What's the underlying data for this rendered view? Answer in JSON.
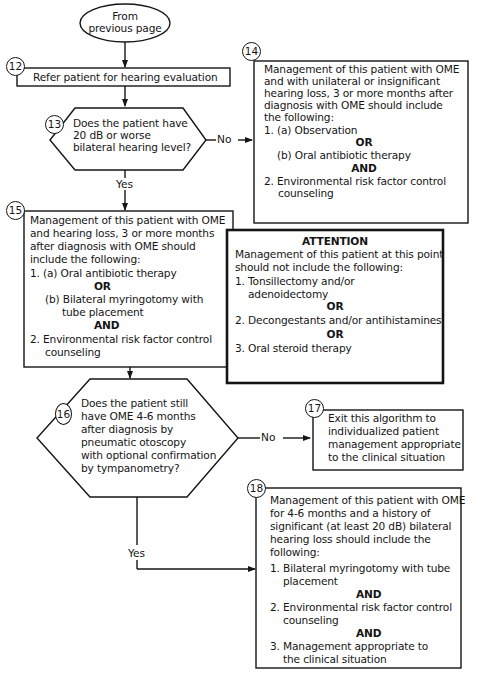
{
  "start": {
    "line1": "From",
    "line2": "previous page"
  },
  "step12": {
    "num": "12",
    "text": "Refer patient for hearing evaluation"
  },
  "step13": {
    "num": "13",
    "lines": [
      "Does the patient have",
      "20 dB or worse",
      "bilateral hearing level?"
    ],
    "yes": "Yes",
    "no": "No"
  },
  "step14": {
    "num": "14",
    "lines": [
      "Management of this patient with OME",
      "and with unilateral or insignificant",
      "hearing loss, 3 or more months after",
      "diagnosis with OME should include",
      "the following:",
      "1. (a) Observation"
    ],
    "or": "OR",
    "b": "(b) Oral antibiotic therapy",
    "and": "AND",
    "item2": [
      "2. Environmental risk factor control",
      "counseling"
    ]
  },
  "step15": {
    "num": "15",
    "lines": [
      "Management of this patient with OME",
      "and hearing loss, 3 or more months",
      "after diagnosis with OME should",
      "include the following:",
      "1. (a) Oral antibiotic therapy"
    ],
    "or": "OR",
    "b": [
      "(b) Bilateral myringotomy with",
      "tube placement"
    ],
    "and": "AND",
    "item2": [
      "2. Environmental risk factor control",
      "counseling"
    ]
  },
  "attention": {
    "heading": "ATTENTION",
    "lines": [
      "Management of this patient at this point",
      "should not include the following:",
      "1. Tonsillectomy and/or",
      "adenoidectomy"
    ],
    "or1": "OR",
    "item2": "2. Decongestants and/or antihistamines",
    "or2": "OR",
    "item3": "3. Oral steroid therapy"
  },
  "step16": {
    "num": "16",
    "lines": [
      "Does the patient still",
      "have OME 4-6 months",
      "after diagnosis by",
      "pneumatic otoscopy",
      "with optional confirmation",
      "by tympanometry?"
    ],
    "yes": "Yes",
    "no": "No"
  },
  "step17": {
    "num": "17",
    "lines": [
      "Exit this algorithm to",
      "individualized patient",
      "management appropriate",
      "to the clinical situation"
    ]
  },
  "step18": {
    "num": "18",
    "lines": [
      "Management of this patient with OME",
      "for 4-6 months and a history of",
      "significant (at least 20 dB) bilateral",
      "hearing loss should include the",
      "following:",
      "1. Bilateral myringotomy with tube",
      "placement"
    ],
    "and1": "AND",
    "item2": [
      "2. Environmental risk factor control",
      "counseling"
    ],
    "and2": "AND",
    "item3": [
      "3. Management appropriate to",
      "the clinical situation"
    ]
  }
}
